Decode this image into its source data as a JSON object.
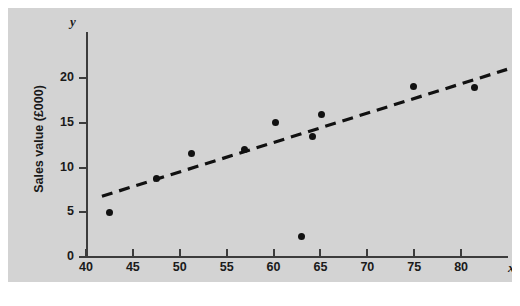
{
  "chart_data": {
    "type": "scatter",
    "title": "",
    "xlabel": "Number of outlets visited",
    "ylabel": "Sales value (£000)",
    "x_var_symbol": "x",
    "y_var_symbol": "y",
    "xlim": [
      40,
      85
    ],
    "ylim": [
      0,
      22.5
    ],
    "xticks": [
      40,
      45,
      50,
      55,
      60,
      65,
      70,
      75,
      80
    ],
    "yticks": [
      0,
      5,
      10,
      15,
      20
    ],
    "xtick_labels": [
      "40",
      "45",
      "50",
      "55",
      "60",
      "65",
      "70",
      "75",
      "80"
    ],
    "ytick_labels": [
      "0",
      "5",
      "10",
      "15",
      "20"
    ],
    "grid": false,
    "legend": null,
    "points": [
      {
        "x": 42.5,
        "y": 5.0
      },
      {
        "x": 47.5,
        "y": 8.8
      },
      {
        "x": 51.3,
        "y": 11.6
      },
      {
        "x": 56.9,
        "y": 12.0
      },
      {
        "x": 60.2,
        "y": 15.1
      },
      {
        "x": 63.0,
        "y": 2.3
      },
      {
        "x": 64.2,
        "y": 13.5
      },
      {
        "x": 65.1,
        "y": 16.0
      },
      {
        "x": 74.9,
        "y": 19.1
      },
      {
        "x": 81.4,
        "y": 19.0
      }
    ],
    "trend_line": {
      "style": "dashed",
      "x_start": 41.7,
      "y_start": 6.8,
      "x_end": 84.9,
      "y_end": 21.0
    },
    "colors": {
      "panel_background": "#d3d3d3",
      "axis": "#3c3c3c",
      "point": "#111111",
      "line": "#111111",
      "text": "#1a1a1a"
    }
  },
  "caption": {
    "text": ""
  }
}
